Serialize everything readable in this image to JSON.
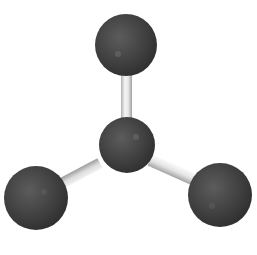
{
  "image": {
    "description": "Ball-and-stick molecular model with trigonal planar geometry: one central atom bonded to three outer atoms",
    "background_color": "#ffffff",
    "atom_color": "#3a3a3a",
    "atom_highlight_color": "#5a5a5a",
    "bond_color": "#e6e6e6",
    "bond_shadow_color": "#a8a8a8"
  },
  "molecule": {
    "geometry": "trigonal planar",
    "central_atom": {
      "cx": 127,
      "cy": 145,
      "r": 28
    },
    "outer_atoms": [
      {
        "name": "top",
        "cx": 126,
        "cy": 45,
        "r": 31
      },
      {
        "name": "bottom-left",
        "cx": 36,
        "cy": 198,
        "r": 32
      },
      {
        "name": "bottom-right",
        "cx": 220,
        "cy": 195,
        "r": 32
      }
    ],
    "bonds": [
      {
        "from": "central",
        "to": "top"
      },
      {
        "from": "central",
        "to": "bottom-left"
      },
      {
        "from": "central",
        "to": "bottom-right"
      }
    ]
  },
  "caption": {
    "text": ""
  }
}
